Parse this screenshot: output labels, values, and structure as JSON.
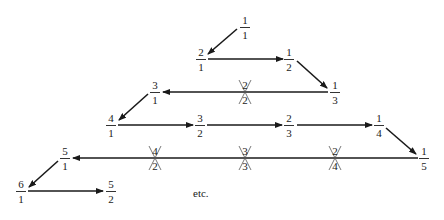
{
  "diagram": {
    "fractions": [
      {
        "id": "f1_1",
        "num": "1",
        "den": "1",
        "x": 245,
        "y": 27,
        "crossed": false
      },
      {
        "id": "f2_1",
        "num": "2",
        "den": "1",
        "x": 201,
        "y": 59,
        "crossed": false
      },
      {
        "id": "f1_2",
        "num": "1",
        "den": "2",
        "x": 289,
        "y": 59,
        "crossed": false
      },
      {
        "id": "f3_1",
        "num": "3",
        "den": "1",
        "x": 155,
        "y": 92,
        "crossed": false
      },
      {
        "id": "f2_2",
        "num": "2",
        "den": "2",
        "x": 245,
        "y": 92,
        "crossed": true
      },
      {
        "id": "f1_3",
        "num": "1",
        "den": "3",
        "x": 335,
        "y": 92,
        "crossed": false
      },
      {
        "id": "f4_1",
        "num": "4",
        "den": "1",
        "x": 111,
        "y": 125,
        "crossed": false
      },
      {
        "id": "f3_2",
        "num": "3",
        "den": "2",
        "x": 200,
        "y": 125,
        "crossed": false
      },
      {
        "id": "f2_3",
        "num": "2",
        "den": "3",
        "x": 289,
        "y": 125,
        "crossed": false
      },
      {
        "id": "f1_4",
        "num": "1",
        "den": "4",
        "x": 379,
        "y": 125,
        "crossed": false
      },
      {
        "id": "f5_1",
        "num": "5",
        "den": "1",
        "x": 65,
        "y": 158,
        "crossed": false
      },
      {
        "id": "f4_2",
        "num": "4",
        "den": "2",
        "x": 155,
        "y": 158,
        "crossed": true
      },
      {
        "id": "f3_3",
        "num": "3",
        "den": "3",
        "x": 245,
        "y": 158,
        "crossed": true
      },
      {
        "id": "f2_4",
        "num": "2",
        "den": "4",
        "x": 335,
        "y": 158,
        "crossed": true
      },
      {
        "id": "f1_5",
        "num": "1",
        "den": "5",
        "x": 424,
        "y": 158,
        "crossed": false
      },
      {
        "id": "f6_1",
        "num": "6",
        "den": "1",
        "x": 21,
        "y": 191,
        "crossed": false
      },
      {
        "id": "f5_2",
        "num": "5",
        "den": "2",
        "x": 111,
        "y": 191,
        "crossed": false
      }
    ],
    "arrows": [
      {
        "from": "1/1",
        "to": "2/1",
        "x1": 237,
        "y1": 29,
        "x2": 208,
        "y2": 54
      },
      {
        "from": "2/1",
        "to": "1/2",
        "x1": 208,
        "y1": 59,
        "x2": 283,
        "y2": 59
      },
      {
        "from": "1/2",
        "to": "1/3",
        "x1": 297,
        "y1": 61,
        "x2": 327,
        "y2": 88
      },
      {
        "from": "1/3",
        "to": "3/1",
        "x1": 328,
        "y1": 92,
        "x2": 163,
        "y2": 92
      },
      {
        "from": "3/1",
        "to": "4/1",
        "x1": 148,
        "y1": 94,
        "x2": 119,
        "y2": 120
      },
      {
        "from": "4/1",
        "to": "3/2",
        "x1": 118,
        "y1": 125,
        "x2": 193,
        "y2": 125
      },
      {
        "from": "3/2",
        "to": "2/3",
        "x1": 207,
        "y1": 125,
        "x2": 282,
        "y2": 125
      },
      {
        "from": "2/3",
        "to": "1/4",
        "x1": 297,
        "y1": 125,
        "x2": 372,
        "y2": 125
      },
      {
        "from": "1/4",
        "to": "1/5",
        "x1": 386,
        "y1": 128,
        "x2": 416,
        "y2": 154
      },
      {
        "from": "1/5",
        "to": "5/1",
        "x1": 418,
        "y1": 158,
        "x2": 73,
        "y2": 158
      },
      {
        "from": "5/1",
        "to": "6/1",
        "x1": 58,
        "y1": 161,
        "x2": 29,
        "y2": 187
      },
      {
        "from": "6/1",
        "to": "5/2",
        "x1": 28,
        "y1": 191,
        "x2": 103,
        "y2": 191
      }
    ],
    "etc_label": "etc.",
    "etc_x": 193,
    "etc_y": 187,
    "line_color": "#1a1a1a"
  }
}
